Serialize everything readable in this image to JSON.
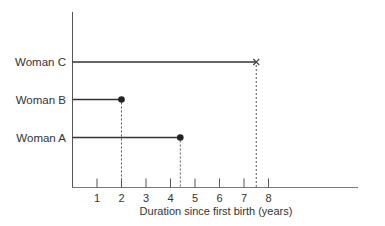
{
  "chart_data": {
    "type": "line",
    "title": "",
    "xlabel": "Duration since first birth (years)",
    "ylabel": "",
    "x_ticks": [
      1,
      2,
      3,
      4,
      5,
      6,
      7,
      8
    ],
    "xlim": [
      0,
      12
    ],
    "grid": false,
    "series": [
      {
        "name": "Woman C",
        "start": 0,
        "end": 7.5,
        "end_marker": "cross",
        "event": "censored"
      },
      {
        "name": "Woman B",
        "start": 0,
        "end": 2.0,
        "end_marker": "dot",
        "event": "birth"
      },
      {
        "name": "Woman A",
        "start": 0,
        "end": 4.4,
        "end_marker": "dot",
        "event": "birth"
      }
    ]
  }
}
